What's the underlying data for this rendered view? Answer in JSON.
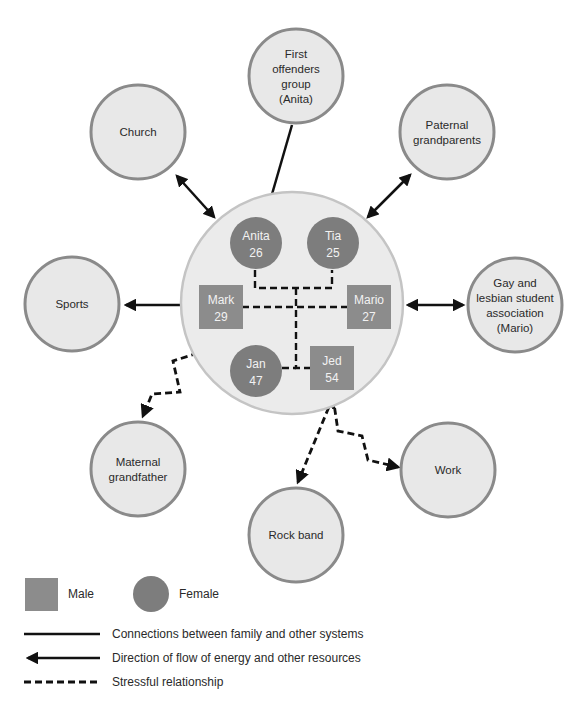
{
  "diagram": {
    "type": "ecomap",
    "family_members": [
      {
        "id": "anita",
        "name": "Anita",
        "age": "26",
        "sex": "female"
      },
      {
        "id": "tia",
        "name": "Tia",
        "age": "25",
        "sex": "female"
      },
      {
        "id": "mark",
        "name": "Mark",
        "age": "29",
        "sex": "male"
      },
      {
        "id": "mario",
        "name": "Mario",
        "age": "27",
        "sex": "male"
      },
      {
        "id": "jan",
        "name": "Jan",
        "age": "47",
        "sex": "female"
      },
      {
        "id": "jed",
        "name": "Jed",
        "age": "54",
        "sex": "male"
      }
    ],
    "systems": [
      {
        "id": "first-offenders",
        "lines": [
          "First",
          "offenders",
          "group",
          "(Anita)"
        ]
      },
      {
        "id": "church",
        "lines": [
          "Church"
        ]
      },
      {
        "id": "paternal-grandparents",
        "lines": [
          "Paternal",
          "grandparents"
        ]
      },
      {
        "id": "sports",
        "lines": [
          "Sports"
        ]
      },
      {
        "id": "gay-lesbian",
        "lines": [
          "Gay and",
          "lesbian student",
          "association",
          "(Mario)"
        ]
      },
      {
        "id": "maternal-grandfather",
        "lines": [
          "Maternal",
          "grandfather"
        ]
      },
      {
        "id": "rock-band",
        "lines": [
          "Rock band"
        ]
      },
      {
        "id": "work",
        "lines": [
          "Work"
        ]
      }
    ],
    "connections": [
      {
        "from": "first-offenders",
        "to": "family",
        "style": "solid",
        "direction": "to-family"
      },
      {
        "from": "church",
        "to": "family",
        "style": "solid",
        "direction": "both"
      },
      {
        "from": "paternal-grandparents",
        "to": "family",
        "style": "solid",
        "direction": "both"
      },
      {
        "from": "mark",
        "to": "sports",
        "style": "solid",
        "direction": "to-system"
      },
      {
        "from": "mario",
        "to": "gay-lesbian",
        "style": "solid",
        "direction": "both"
      },
      {
        "from": "family",
        "to": "maternal-grandfather",
        "style": "dashed",
        "direction": "to-system"
      },
      {
        "from": "jed",
        "to": "rock-band",
        "style": "dashed",
        "direction": "both"
      },
      {
        "from": "jed",
        "to": "work",
        "style": "dashed",
        "direction": "to-system"
      }
    ]
  },
  "legend": {
    "male": "Male",
    "female": "Female",
    "solid_line": "Connections between family and other systems",
    "arrow_line": "Direction of flow of energy and other resources",
    "dashed_line": "Stressful relationship"
  },
  "colors": {
    "system_fill": "#e8e8e8",
    "member_fill": "#808080",
    "line": "#111111"
  }
}
